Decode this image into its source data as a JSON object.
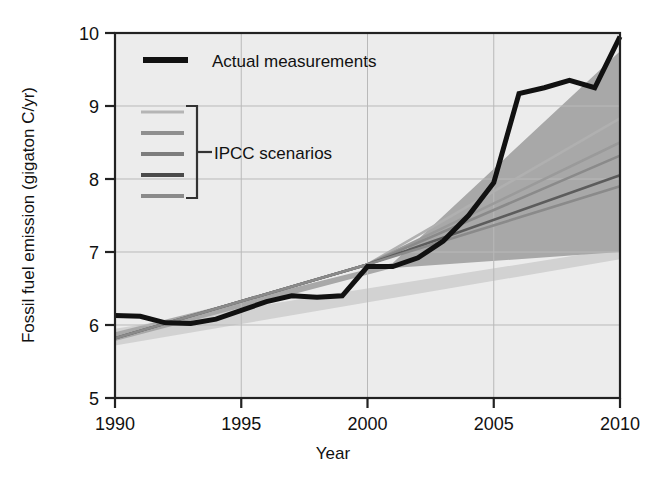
{
  "chart_data": {
    "type": "line",
    "title": "",
    "xlabel": "Year",
    "ylabel": "Fossil fuel emission (gigaton C/yr)",
    "xlim": [
      1990,
      2010
    ],
    "ylim": [
      5,
      10
    ],
    "xticks": [
      "1990",
      "1995",
      "2000",
      "2005",
      "2010"
    ],
    "xtick_values": [
      1990,
      1995,
      2000,
      2005,
      2010
    ],
    "yticks": [
      "5",
      "6",
      "7",
      "8",
      "9",
      "10"
    ],
    "ytick_values": [
      5,
      6,
      7,
      8,
      9,
      10
    ],
    "grid": true,
    "legend_position": "upper-left-inside",
    "plot_background": "#ececec",
    "band_color": "#a8a8a8",
    "band_color_light": "#cccccc",
    "actual_color": "#111111",
    "series": [
      {
        "name": "Actual measurements",
        "style": "thick-black-line",
        "color": "#111111",
        "x": [
          1990,
          1991,
          1992,
          1993,
          1994,
          1995,
          1996,
          1997,
          1998,
          1999,
          2000,
          2001,
          2002,
          2003,
          2004,
          2005,
          2006,
          2007,
          2008,
          2009,
          2010
        ],
        "values": [
          6.13,
          6.12,
          6.03,
          6.02,
          6.08,
          6.2,
          6.32,
          6.4,
          6.38,
          6.4,
          6.8,
          6.8,
          6.92,
          7.15,
          7.5,
          7.95,
          9.17,
          9.25,
          9.35,
          9.25,
          9.95
        ]
      },
      {
        "name": "IPCC scenario 1",
        "style": "thin-gray-line",
        "color": "#b0b0b0",
        "x": [
          1990,
          2000,
          2010
        ],
        "values": [
          5.82,
          6.83,
          8.83
        ]
      },
      {
        "name": "IPCC scenario 2",
        "style": "thin-gray-line",
        "color": "#9a9a9a",
        "x": [
          1990,
          2000,
          2010
        ],
        "values": [
          5.82,
          6.83,
          8.5
        ]
      },
      {
        "name": "IPCC scenario 3",
        "style": "thin-gray-line",
        "color": "#8a8a8a",
        "x": [
          1990,
          2000,
          2010
        ],
        "values": [
          5.82,
          6.83,
          8.32
        ]
      },
      {
        "name": "IPCC scenario 4",
        "style": "thin-gray-line",
        "color": "#5c5c5c",
        "x": [
          1990,
          2000,
          2010
        ],
        "values": [
          5.82,
          6.83,
          8.05
        ]
      },
      {
        "name": "IPCC scenario 5",
        "style": "thin-gray-line",
        "color": "#8a8a8a",
        "x": [
          1990,
          2000,
          2010
        ],
        "values": [
          5.82,
          6.83,
          7.9
        ]
      }
    ],
    "uncertainty_band": {
      "name": "IPCC scenario range",
      "x": [
        1990,
        2001,
        2010
      ],
      "upper": [
        5.9,
        6.85,
        9.75
      ],
      "lower": [
        5.78,
        6.78,
        7.0
      ]
    },
    "annotations": []
  },
  "legend": {
    "actual": {
      "label": "Actual measurements",
      "swatch": "thick-black-bar"
    },
    "scenarios": {
      "label": "IPCC scenarios",
      "swatch": "bracket-with-five-gray-bars",
      "bar_colors": [
        "#b5b5b5",
        "#8f8f8f",
        "#7d7d7d",
        "#4a4a4a",
        "#8a8a8a"
      ]
    }
  }
}
